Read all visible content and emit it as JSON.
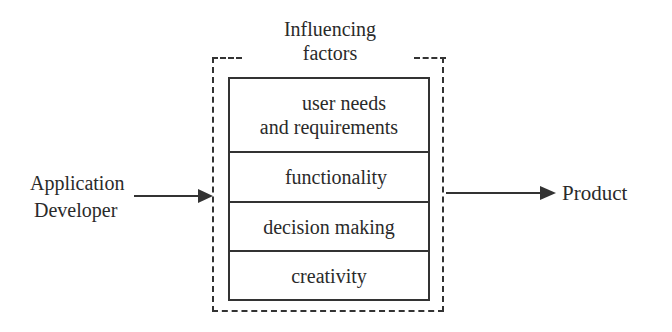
{
  "diagram": {
    "group_title_lines": [
      "Influencing",
      "factors"
    ],
    "factors": [
      {
        "label": "user needs and requirements",
        "lines": [
          "user needs",
          "and requirements"
        ]
      },
      {
        "label": "functionality"
      },
      {
        "label": "decision making"
      },
      {
        "label": "creativity"
      }
    ],
    "input": {
      "lines": [
        "Application",
        "Developer"
      ]
    },
    "output": {
      "label": "Product"
    },
    "edges": [
      {
        "from": "Application Developer",
        "to": "Influencing factors"
      },
      {
        "from": "Influencing factors",
        "to": "Product"
      }
    ],
    "colors": {
      "stroke": "#333333",
      "text": "#2a2a2a",
      "background": "#ffffff"
    }
  }
}
